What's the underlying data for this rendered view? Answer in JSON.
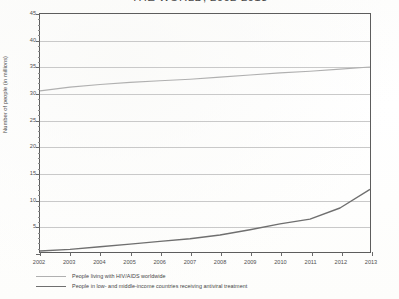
{
  "chart_data": {
    "type": "line",
    "title": "THE WORLD, 2002-2013",
    "xlabel": "",
    "ylabel": "Number of people (in millions)",
    "categories": [
      "2002",
      "2003",
      "2004",
      "2005",
      "2006",
      "2007",
      "2008",
      "2009",
      "2010",
      "2011",
      "2012",
      "2013"
    ],
    "x": [
      2002,
      2003,
      2004,
      2005,
      2006,
      2007,
      2008,
      2009,
      2010,
      2011,
      2012,
      2013
    ],
    "ylim": [
      0,
      45
    ],
    "yticks": [
      0,
      5,
      10,
      15,
      20,
      25,
      30,
      35,
      40,
      45
    ],
    "ytick_labels": [
      "",
      "5",
      "10",
      "15",
      "20",
      "25",
      "30",
      "35",
      "40",
      "45"
    ],
    "grid": true,
    "legend_position": "below",
    "series": [
      {
        "name": "People living with HIV/AIDS worldwide",
        "color": "#b0b0b0",
        "values": [
          30.5,
          31.2,
          31.7,
          32.1,
          32.4,
          32.7,
          33.1,
          33.5,
          33.9,
          34.2,
          34.6,
          35.0
        ]
      },
      {
        "name": "People in low- and middle-income countries receiving antiviral treatment",
        "color": "#6f6f6f",
        "values": [
          0.3,
          0.6,
          1.1,
          1.6,
          2.1,
          2.6,
          3.3,
          4.3,
          5.4,
          6.3,
          8.4,
          11.9
        ]
      }
    ]
  },
  "legend": {
    "items": [
      {
        "label": "People living with HIV/AIDS worldwide"
      },
      {
        "label": "People in low- and middle-income countries receiving antiviral treatment"
      }
    ]
  }
}
